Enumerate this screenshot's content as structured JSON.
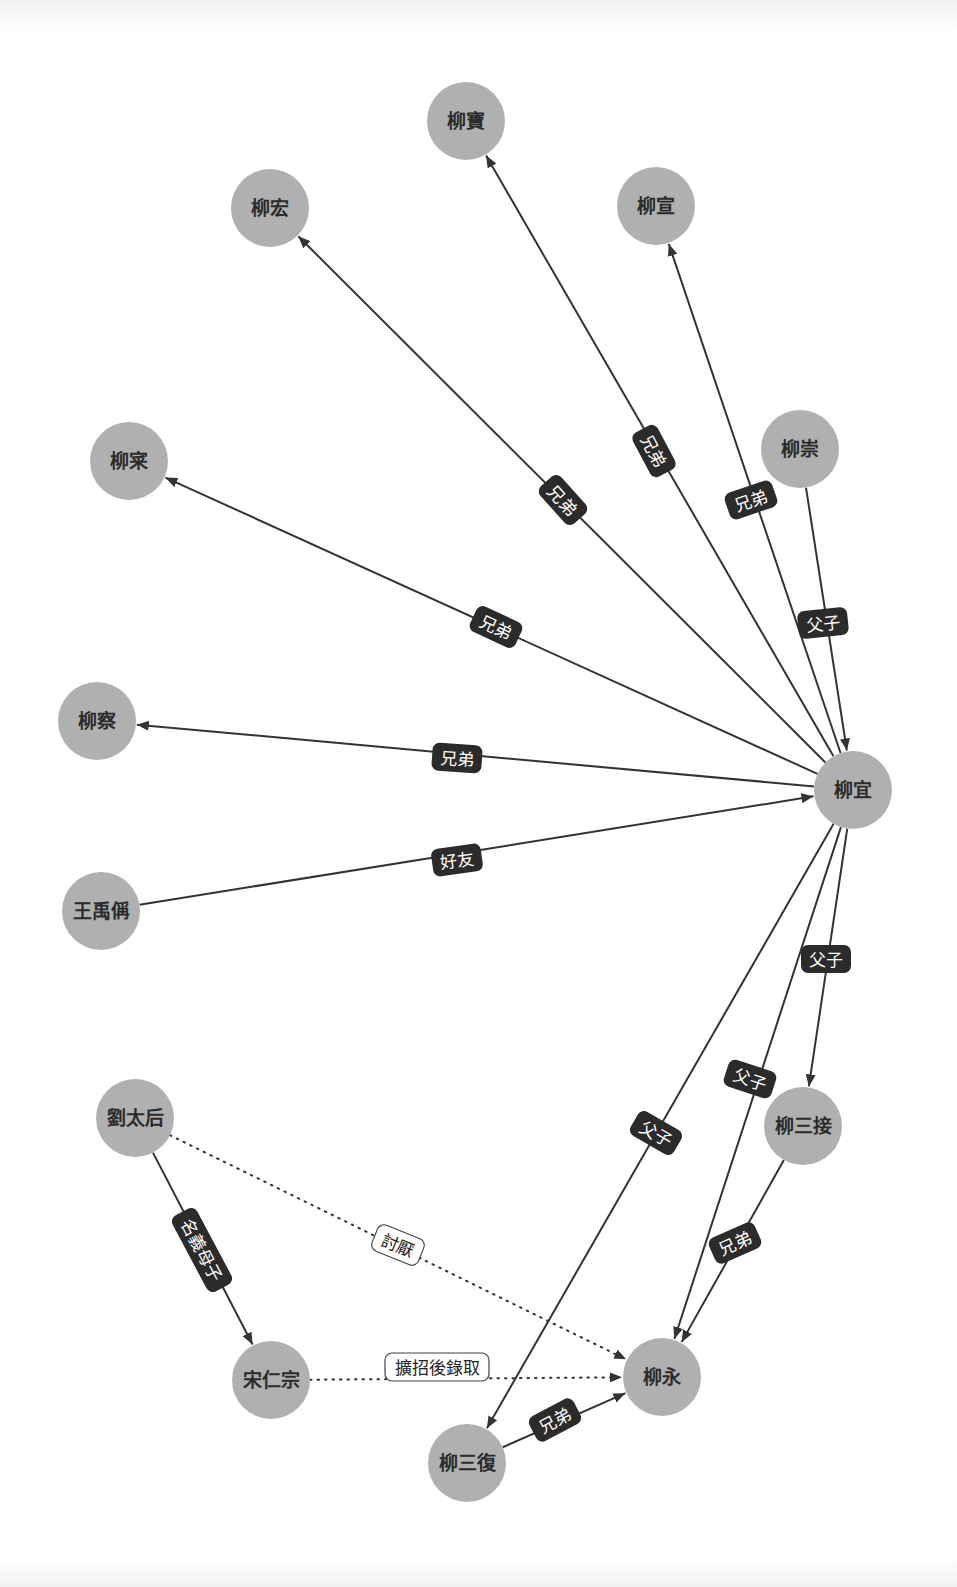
{
  "diagram": {
    "type": "relationship-graph",
    "colors": {
      "node_fill": "#b0b0b0",
      "node_text": "#2b2b2b",
      "edge": "#333333",
      "label_dark_bg": "#2b2b2b",
      "label_dark_text": "#ffffff",
      "label_light_bg": "#ffffff"
    },
    "nodes": [
      {
        "id": "n_liubao",
        "label": "柳寶",
        "x": 466,
        "y": 121
      },
      {
        "id": "n_liuhong",
        "label": "柳宏",
        "x": 270,
        "y": 208
      },
      {
        "id": "n_liuxuan",
        "label": "柳宣",
        "x": 656,
        "y": 206
      },
      {
        "id": "n_liuchong",
        "label": "柳崇",
        "x": 800,
        "y": 449
      },
      {
        "id": "n_liucai",
        "label": "柳宷",
        "x": 129,
        "y": 461
      },
      {
        "id": "n_liucha",
        "label": "柳察",
        "x": 97,
        "y": 721
      },
      {
        "id": "n_liuyi",
        "label": "柳宜",
        "x": 853,
        "y": 790
      },
      {
        "id": "n_wangyucheng",
        "label": "王禹偁",
        "x": 101,
        "y": 911
      },
      {
        "id": "n_liutaihou",
        "label": "劉太后",
        "x": 135,
        "y": 1118
      },
      {
        "id": "n_liusanjie",
        "label": "柳三接",
        "x": 803,
        "y": 1126
      },
      {
        "id": "n_songrenzong",
        "label": "宋仁宗",
        "x": 271,
        "y": 1380
      },
      {
        "id": "n_liuyong",
        "label": "柳永",
        "x": 662,
        "y": 1377
      },
      {
        "id": "n_liusanfu",
        "label": "柳三復",
        "x": 467,
        "y": 1463
      }
    ],
    "edges": [
      {
        "from": "n_liuyi",
        "to": "n_liubao",
        "label": "兄弟",
        "style": "solid",
        "lx": 654,
        "ly": 451,
        "angle": 62
      },
      {
        "from": "n_liuyi",
        "to": "n_liuhong",
        "label": "兄弟",
        "style": "solid",
        "lx": 563,
        "ly": 500,
        "angle": 48
      },
      {
        "from": "n_liuyi",
        "to": "n_liuxuan",
        "label": "兄弟",
        "style": "solid",
        "lx": 751,
        "ly": 500,
        "angle": -19
      },
      {
        "from": "n_liuchong",
        "to": "n_liuyi",
        "label": "父子",
        "style": "solid",
        "lx": 823,
        "ly": 623,
        "angle": -6
      },
      {
        "from": "n_liuyi",
        "to": "n_liucai",
        "label": "兄弟",
        "style": "solid",
        "lx": 496,
        "ly": 627,
        "angle": 25
      },
      {
        "from": "n_liuyi",
        "to": "n_liucha",
        "label": "兄弟",
        "style": "solid",
        "lx": 457,
        "ly": 758,
        "angle": 4
      },
      {
        "from": "n_wangyucheng",
        "to": "n_liuyi",
        "label": "好友",
        "style": "solid",
        "lx": 457,
        "ly": 860,
        "angle": -8
      },
      {
        "from": "n_liuyi",
        "to": "n_liusanjie",
        "label": "父子",
        "style": "solid",
        "lx": 826,
        "ly": 959,
        "angle": 0
      },
      {
        "from": "n_liuyi",
        "to": "n_liuyong",
        "label": "父子",
        "style": "solid",
        "lx": 750,
        "ly": 1079,
        "angle": 18
      },
      {
        "from": "n_liuyi",
        "to": "n_liusanfu",
        "label": "父子",
        "style": "solid",
        "lx": 656,
        "ly": 1133,
        "angle": 30
      },
      {
        "from": "n_liusanjie",
        "to": "n_liuyong",
        "label": "兄弟",
        "style": "solid",
        "lx": 735,
        "ly": 1243,
        "angle": -24
      },
      {
        "from": "n_liusanfu",
        "to": "n_liuyong",
        "label": "兄弟",
        "style": "solid",
        "lx": 555,
        "ly": 1420,
        "angle": -28
      },
      {
        "from": "n_liutaihou",
        "to": "n_songrenzong",
        "label": "名義母子",
        "style": "solid",
        "lx": 202,
        "ly": 1250,
        "angle": 62
      },
      {
        "from": "n_liutaihou",
        "to": "n_liuyong",
        "label": "討厭",
        "style": "dotted",
        "lx": 398,
        "ly": 1245,
        "angle": 22
      },
      {
        "from": "n_songrenzong",
        "to": "n_liuyong",
        "label": "擴招後錄取",
        "style": "dotted",
        "lx": 437,
        "ly": 1367,
        "angle": 0
      }
    ]
  }
}
